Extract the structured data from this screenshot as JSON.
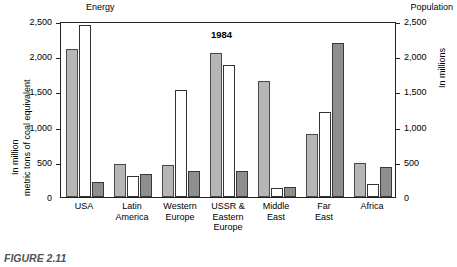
{
  "headings": {
    "left": "Energy",
    "right": "Population"
  },
  "axis_titles": {
    "left_line1": "In million",
    "left_line2": "metric tons of coal equivalent",
    "right": "In millions"
  },
  "annotation": "1984",
  "caption": "FIGURE 2.11",
  "colors": {
    "series_light": "#b6b6b6",
    "series_white": "#ffffff",
    "series_dark": "#8e8e8e",
    "axis": "#222222"
  },
  "chart_data": {
    "type": "bar",
    "title": "1984",
    "xlabel": "",
    "ylabel": "In million metric tons of coal equivalent",
    "y2label": "In millions",
    "ylim": [
      0,
      2500
    ],
    "y2lim": [
      0,
      2500
    ],
    "yticks": [
      0,
      500,
      1000,
      1500,
      2000,
      2500
    ],
    "ytick_labels": [
      "0",
      "500",
      "1,000",
      "1,500",
      "2,000",
      "2,500"
    ],
    "y2tick_labels": [
      "0",
      "500",
      "1,000",
      "1,500",
      "2,000",
      "2,500"
    ],
    "grid": false,
    "legend": "none",
    "categories": [
      "USA",
      "Latin\nAmerica",
      "Western\nEurope",
      "USSR &\nEastern\nEurope",
      "Middle\nEast",
      "Far\nEast",
      "Africa"
    ],
    "series": [
      {
        "name": "Energy production",
        "color": "#b6b6b6",
        "axis": "left",
        "values": [
          2100,
          470,
          460,
          2040,
          1650,
          890,
          480
        ]
      },
      {
        "name": "Energy consumption",
        "color": "#ffffff",
        "axis": "left",
        "values": [
          2450,
          295,
          1525,
          1880,
          130,
          1210,
          185
        ]
      },
      {
        "name": "Population",
        "color": "#8e8e8e",
        "axis": "right",
        "values": [
          220,
          330,
          375,
          375,
          140,
          2190,
          425
        ]
      }
    ]
  }
}
